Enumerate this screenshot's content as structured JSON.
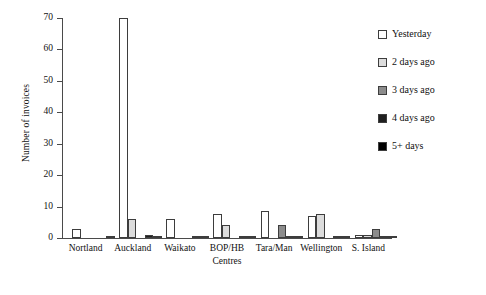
{
  "chart_data": {
    "type": "bar",
    "title": "",
    "xlabel": "Centres",
    "ylabel": "Number of invoices",
    "ylim": [
      0,
      70
    ],
    "yticks": [
      0,
      10,
      20,
      30,
      40,
      50,
      60,
      70
    ],
    "grid": false,
    "legend_position": "right",
    "categories": [
      "Nortland",
      "Auckland",
      "Waikato",
      "BOP/HB",
      "Tara/Man",
      "Wellington",
      "S. Island"
    ],
    "series": [
      {
        "name": "Yesterday",
        "color": "#ffffff",
        "values": [
          3,
          70,
          6,
          7.5,
          8.5,
          7,
          1
        ]
      },
      {
        "name": "2 days ago",
        "color": "#dcdcdc",
        "values": [
          0,
          6,
          0,
          4,
          0,
          7.5,
          1
        ]
      },
      {
        "name": "3 days ago",
        "color": "#8c8c8c",
        "values": [
          0,
          0,
          0,
          0,
          4,
          0,
          3
        ]
      },
      {
        "name": "4 days ago",
        "color": "#1f1f1f",
        "values": [
          0,
          1,
          0.8,
          0.8,
          0.5,
          0.6,
          0.5
        ]
      },
      {
        "name": "5+ days",
        "color": "#000000",
        "values": [
          0.4,
          0.5,
          0.5,
          0.5,
          0.4,
          0.5,
          0.4
        ]
      }
    ]
  },
  "axes": {
    "y_title": "Number of invoices",
    "x_title": "Centres",
    "y_tick_labels": [
      "0",
      "10",
      "20",
      "30",
      "40",
      "50",
      "60",
      "70"
    ],
    "x_tick_labels": [
      "Nortland",
      "Auckland",
      "Waikato",
      "BOP/HB",
      "Tara/Man",
      "Wellington",
      "S. Island"
    ]
  },
  "legend": {
    "items": [
      {
        "label": "Yesterday",
        "color": "#ffffff"
      },
      {
        "label": "2 days ago",
        "color": "#dcdcdc"
      },
      {
        "label": "3 days ago",
        "color": "#8c8c8c"
      },
      {
        "label": "4 days ago",
        "color": "#1f1f1f"
      },
      {
        "label": "5+ days",
        "color": "#000000"
      }
    ]
  }
}
